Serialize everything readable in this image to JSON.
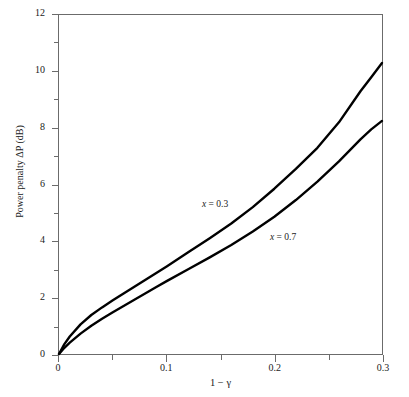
{
  "figure": {
    "background_color": "#ffffff",
    "frame_color": "#6b6b6b",
    "curve_color": "#000000"
  },
  "chart_data": {
    "type": "line",
    "title": "",
    "subtitle": "",
    "xlabel": "1 − γ",
    "ylabel": "Power penalty ΔP (dB)",
    "xlim": [
      0,
      0.3
    ],
    "ylim": [
      0,
      12
    ],
    "grid": false,
    "legend_position": "inline-annotations",
    "x_major_ticks": [
      0,
      0.1,
      0.2,
      0.3
    ],
    "x_major_tick_labels": [
      "0",
      "0.1",
      "0.2",
      "0.3"
    ],
    "x_minor_ticks": [
      0.05,
      0.15,
      0.25
    ],
    "y_major_ticks": [
      0,
      2,
      4,
      6,
      8,
      10,
      12
    ],
    "y_major_tick_labels": [
      "0",
      "2",
      "4",
      "6",
      "8",
      "10",
      "12"
    ],
    "y_minor_ticks": [
      1,
      3,
      5,
      7,
      9,
      11
    ],
    "series": [
      {
        "name": "x = 0.3",
        "label": "x = 0.3",
        "annotation_text": "x = 0.3",
        "x": [
          0.0,
          0.005,
          0.01,
          0.02,
          0.03,
          0.04,
          0.05,
          0.06,
          0.07,
          0.08,
          0.09,
          0.1,
          0.12,
          0.14,
          0.16,
          0.18,
          0.2,
          0.22,
          0.24,
          0.26,
          0.28,
          0.29,
          0.3
        ],
        "values": [
          0.0,
          0.35,
          0.62,
          1.05,
          1.38,
          1.65,
          1.9,
          2.14,
          2.38,
          2.62,
          2.86,
          3.1,
          3.6,
          4.1,
          4.62,
          5.2,
          5.85,
          6.55,
          7.3,
          8.2,
          9.3,
          9.8,
          10.3
        ]
      },
      {
        "name": "x = 0.7",
        "label": "x = 0.7",
        "annotation_text": "x = 0.7",
        "x": [
          0.0,
          0.005,
          0.01,
          0.02,
          0.03,
          0.04,
          0.05,
          0.06,
          0.07,
          0.08,
          0.09,
          0.1,
          0.12,
          0.14,
          0.16,
          0.18,
          0.2,
          0.22,
          0.24,
          0.26,
          0.28,
          0.29,
          0.3
        ],
        "values": [
          0.0,
          0.22,
          0.4,
          0.72,
          1.0,
          1.25,
          1.48,
          1.7,
          1.92,
          2.14,
          2.36,
          2.58,
          3.0,
          3.42,
          3.86,
          4.34,
          4.86,
          5.45,
          6.1,
          6.82,
          7.6,
          7.95,
          8.25
        ]
      }
    ],
    "annotations": [
      {
        "text": "x = 0.3",
        "x": 0.133,
        "y": 5.43
      },
      {
        "text": "x = 0.7",
        "x": 0.196,
        "y": 4.27
      }
    ]
  }
}
